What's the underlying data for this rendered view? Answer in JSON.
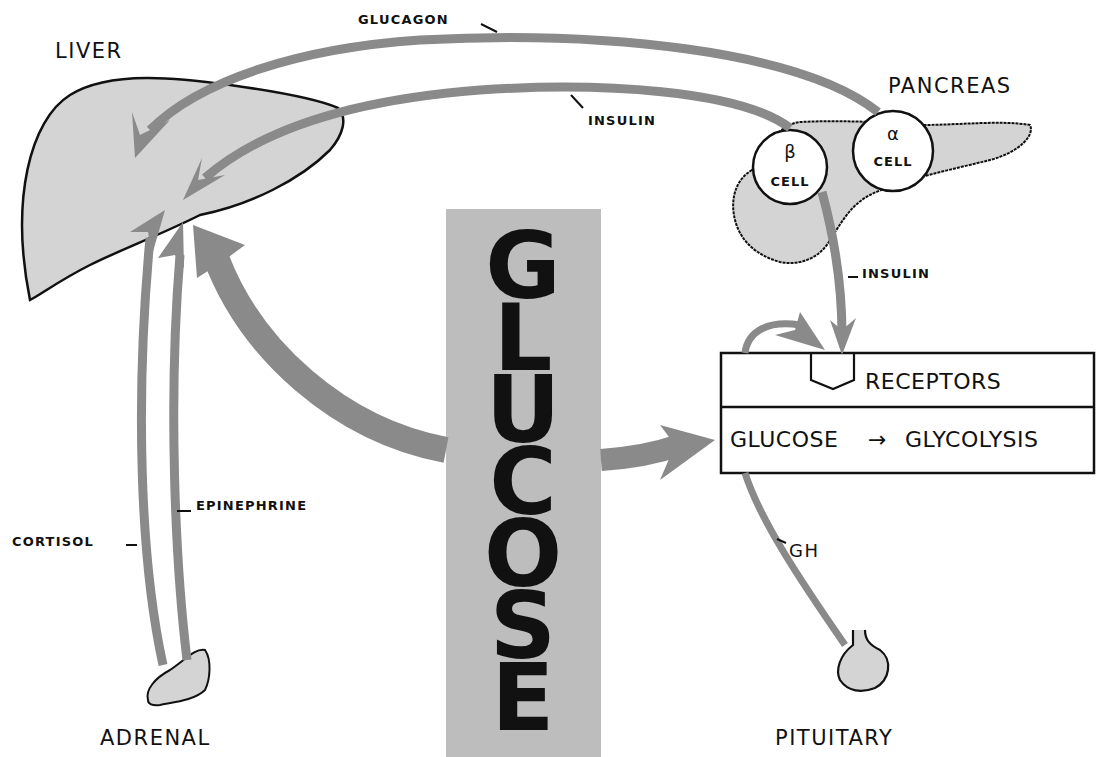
{
  "diagram": {
    "organs": {
      "liver": "LIVER",
      "pancreas": "PANCREAS",
      "adrenal": "ADRENAL",
      "pituitary": "PITUITARY"
    },
    "pancreas_cells": {
      "beta_symbol": "β",
      "beta_label": "CELL",
      "alpha_symbol": "α",
      "alpha_label": "CELL"
    },
    "hormones": {
      "glucagon": "GLUCAGON",
      "insulin_to_liver": "INSULIN",
      "insulin_to_receptors": "INSULIN",
      "cortisol": "CORTISOL",
      "epinephrine": "EPINEPHRINE",
      "gh": "GH"
    },
    "central_column": {
      "letters": [
        "G",
        "L",
        "U",
        "C",
        "O",
        "S",
        "E"
      ]
    },
    "cell_box": {
      "top_row": "RECEPTORS",
      "bottom_row_left": "GLUCOSE",
      "bottom_row_arrow": "→",
      "bottom_row_right": "GLYCOLYSIS"
    },
    "colors": {
      "arrow_gray": "#8a8a8a",
      "organ_fill": "#d4d4d4",
      "glucose_bar": "#bdbdbd",
      "outline": "#111111"
    }
  }
}
